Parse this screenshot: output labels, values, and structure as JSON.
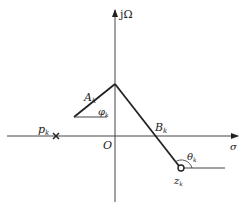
{
  "diagram": {
    "type": "s-plane pole-zero vector diagram",
    "axes": {
      "vertical_label": "jΩ",
      "horizontal_label": "σ",
      "origin_label": "O"
    },
    "pole": {
      "label": "p",
      "subscript": "k",
      "marker": "cross"
    },
    "zero": {
      "label": "z",
      "subscript": "k",
      "marker": "circle"
    },
    "vectors": [
      {
        "label": "A",
        "subscript": "k",
        "angle_label": "φ",
        "angle_subscript": "k"
      },
      {
        "label": "B",
        "subscript": "k",
        "angle_label": "θ",
        "angle_subscript": "k"
      }
    ],
    "colors": {
      "line": "#222222",
      "background": "#ffffff"
    }
  }
}
